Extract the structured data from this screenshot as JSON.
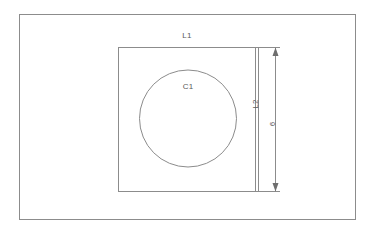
{
  "drawing": {
    "title": "Parametric sketch with outer frame, inner square and inscribed circle",
    "background_color": "#ffffff",
    "line_color": "#8c8c8c",
    "text_color": "#5a5a5a",
    "labels": {
      "outer_frame": "",
      "square_top": "L1",
      "square_side": "L2",
      "circle": "C1",
      "dimension_value": "6"
    },
    "geometry": {
      "outer_rect": {
        "x": 19,
        "y": 14,
        "width": 337,
        "height": 206
      },
      "inner_square": {
        "x": 118,
        "y": 47,
        "width": 138,
        "height": 145
      },
      "circle": {
        "cx": 188,
        "cy": 118,
        "r": 49
      },
      "extension_line_x": 258,
      "dimension_line_x": 275,
      "dimension_top_y": 47,
      "dimension_bottom_y": 192
    },
    "label_positions": {
      "square_top": {
        "x": 187,
        "y": 38
      },
      "circle": {
        "x": 188,
        "y": 89
      },
      "square_side": {
        "x": 258,
        "y": 104
      },
      "dimension_value": {
        "x": 275,
        "y": 124
      }
    },
    "icons": {
      "arrow_up": "arrow-up-icon",
      "arrow_down": "arrow-down-icon"
    }
  }
}
